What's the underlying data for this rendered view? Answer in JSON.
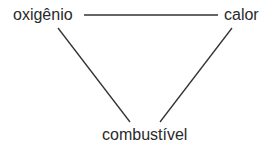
{
  "diagram": {
    "type": "fire-triangle",
    "nodes": [
      {
        "id": "oxygen",
        "label": "oxigênio"
      },
      {
        "id": "heat",
        "label": "calor"
      },
      {
        "id": "fuel",
        "label": "combustível"
      }
    ],
    "edges": [
      {
        "from": "oxygen",
        "to": "heat"
      },
      {
        "from": "oxygen",
        "to": "fuel"
      },
      {
        "from": "heat",
        "to": "fuel"
      }
    ],
    "line_color": "#333333",
    "text_color": "#2a2a2a"
  }
}
